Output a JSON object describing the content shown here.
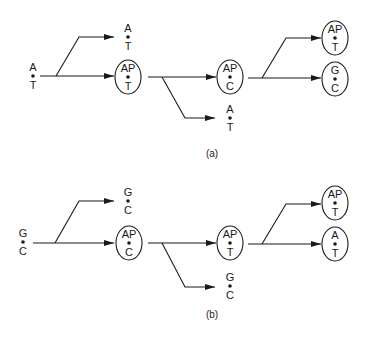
{
  "colors": {
    "ink": "#1a1a1a",
    "background": "#ffffff"
  },
  "panels": [
    {
      "id": "a",
      "caption": "(a)",
      "nodes": [
        {
          "id": "a-start",
          "top": "A",
          "bottom": "T",
          "enclosed": false,
          "x": 33,
          "y": 76
        },
        {
          "id": "a-gen1-up",
          "top": "A",
          "bottom": "T",
          "enclosed": false,
          "x": 128,
          "y": 37
        },
        {
          "id": "a-gen1-mid",
          "top": "AP",
          "bottom": "T",
          "enclosed": true,
          "x": 128,
          "y": 76
        },
        {
          "id": "a-gen2-mid",
          "top": "AP",
          "bottom": "C",
          "enclosed": true,
          "x": 230,
          "y": 76
        },
        {
          "id": "a-gen2-low",
          "top": "A",
          "bottom": "T",
          "enclosed": false,
          "x": 230,
          "y": 118
        },
        {
          "id": "a-gen3-up",
          "top": "AP",
          "bottom": "T",
          "enclosed": true,
          "x": 335,
          "y": 38
        },
        {
          "id": "a-gen3-low",
          "top": "G",
          "bottom": "C",
          "enclosed": true,
          "x": 335,
          "y": 79
        }
      ]
    },
    {
      "id": "b",
      "caption": "(b)",
      "nodes": [
        {
          "id": "b-start",
          "top": "G",
          "bottom": "C",
          "enclosed": false,
          "x": 23,
          "y": 242
        },
        {
          "id": "b-gen1-up",
          "top": "G",
          "bottom": "C",
          "enclosed": false,
          "x": 128,
          "y": 201
        },
        {
          "id": "b-gen1-mid",
          "top": "AP",
          "bottom": "C",
          "enclosed": true,
          "x": 129,
          "y": 243
        },
        {
          "id": "b-gen2-mid",
          "top": "AP",
          "bottom": "T",
          "enclosed": true,
          "x": 230,
          "y": 243
        },
        {
          "id": "b-gen2-low",
          "top": "G",
          "bottom": "C",
          "enclosed": false,
          "x": 230,
          "y": 286
        },
        {
          "id": "b-gen3-up",
          "top": "AP",
          "bottom": "T",
          "enclosed": true,
          "x": 335,
          "y": 203
        },
        {
          "id": "b-gen3-low",
          "top": "A",
          "bottom": "T",
          "enclosed": true,
          "x": 335,
          "y": 244
        }
      ]
    }
  ]
}
